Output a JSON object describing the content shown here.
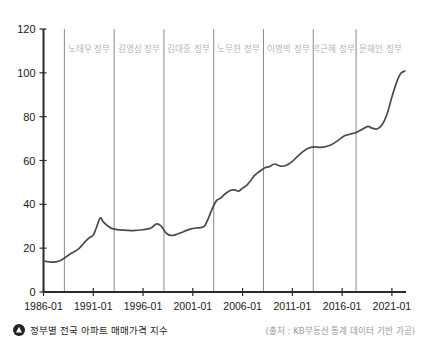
{
  "caption": {
    "icon": "triangle-up-circle-icon",
    "text": "정부별 전국 아파트 매매가격 지수",
    "source": "(출처 : KB부동산 통계 데이터 기반 가공)"
  },
  "chart_data": {
    "type": "line",
    "title": "정부별 전국 아파트 매매가격 지수",
    "xlabel": "",
    "ylabel": "",
    "ylim": [
      0,
      120
    ],
    "yticks": [
      0,
      20,
      40,
      60,
      80,
      100,
      120
    ],
    "xlim": [
      "1986-01",
      "2022-06"
    ],
    "xticks": [
      "1986-01",
      "1991-01",
      "1996-01",
      "2001-01",
      "2006-01",
      "2011-01",
      "2016-01",
      "2021-01"
    ],
    "grid": false,
    "legend": "none",
    "line_color": "#4a4a4a",
    "annotations": [
      {
        "label": "노태우 정부",
        "start": "1988-02",
        "end": "1993-02"
      },
      {
        "label": "김영삼 정부",
        "start": "1993-02",
        "end": "1998-02"
      },
      {
        "label": "김대중 정부",
        "start": "1998-02",
        "end": "2003-02"
      },
      {
        "label": "노무현 정부",
        "start": "2003-02",
        "end": "2008-02"
      },
      {
        "label": "이명박 정부",
        "start": "2008-02",
        "end": "2013-02"
      },
      {
        "label": "박근혜 정부",
        "start": "2013-02",
        "end": "2017-03"
      },
      {
        "label": "문재인 정부",
        "start": "2017-05",
        "end": "2022-05"
      }
    ],
    "divider_years": [
      1988.1,
      1993.1,
      1998.1,
      2003.1,
      2008.1,
      2013.1,
      2017.4
    ],
    "x": [
      1986.0,
      1986.5,
      1987.0,
      1987.5,
      1988.0,
      1988.5,
      1989.0,
      1989.5,
      1990.0,
      1990.5,
      1991.0,
      1991.3,
      1991.7,
      1992.0,
      1992.5,
      1993.0,
      1994.0,
      1995.0,
      1996.0,
      1996.8,
      1997.3,
      1997.8,
      1998.3,
      1998.8,
      1999.3,
      1999.8,
      2000.3,
      2000.8,
      2001.3,
      2001.8,
      2002.2,
      2002.6,
      2003.0,
      2003.4,
      2003.8,
      2004.2,
      2004.8,
      2005.2,
      2005.6,
      2006.0,
      2006.4,
      2006.8,
      2007.2,
      2007.7,
      2008.2,
      2008.7,
      2009.2,
      2009.8,
      2010.4,
      2011.0,
      2011.5,
      2012.0,
      2012.6,
      2013.2,
      2013.8,
      2014.4,
      2015.0,
      2015.6,
      2016.2,
      2016.8,
      2017.4,
      2018.0,
      2018.6,
      2019.0,
      2019.5,
      2020.0,
      2020.5,
      2021.0,
      2021.5,
      2021.9,
      2022.3
    ],
    "y": [
      14.2,
      13.8,
      13.6,
      14.0,
      15.2,
      16.8,
      18.2,
      19.6,
      22.0,
      24.4,
      26.0,
      29.2,
      33.8,
      32.0,
      30.0,
      28.8,
      28.2,
      28.0,
      28.4,
      29.2,
      31.0,
      30.2,
      27.0,
      25.8,
      26.2,
      27.0,
      28.0,
      28.8,
      29.2,
      29.4,
      30.2,
      34.0,
      38.5,
      41.8,
      42.8,
      44.6,
      46.4,
      46.6,
      46.0,
      47.4,
      48.6,
      50.8,
      53.2,
      55.0,
      56.6,
      57.2,
      58.4,
      57.4,
      57.8,
      59.6,
      61.8,
      63.8,
      65.6,
      66.2,
      66.0,
      66.4,
      67.4,
      69.2,
      71.2,
      72.0,
      72.8,
      74.2,
      75.6,
      74.8,
      74.4,
      76.2,
      81.0,
      89.0,
      96.0,
      99.8,
      100.8
    ]
  }
}
